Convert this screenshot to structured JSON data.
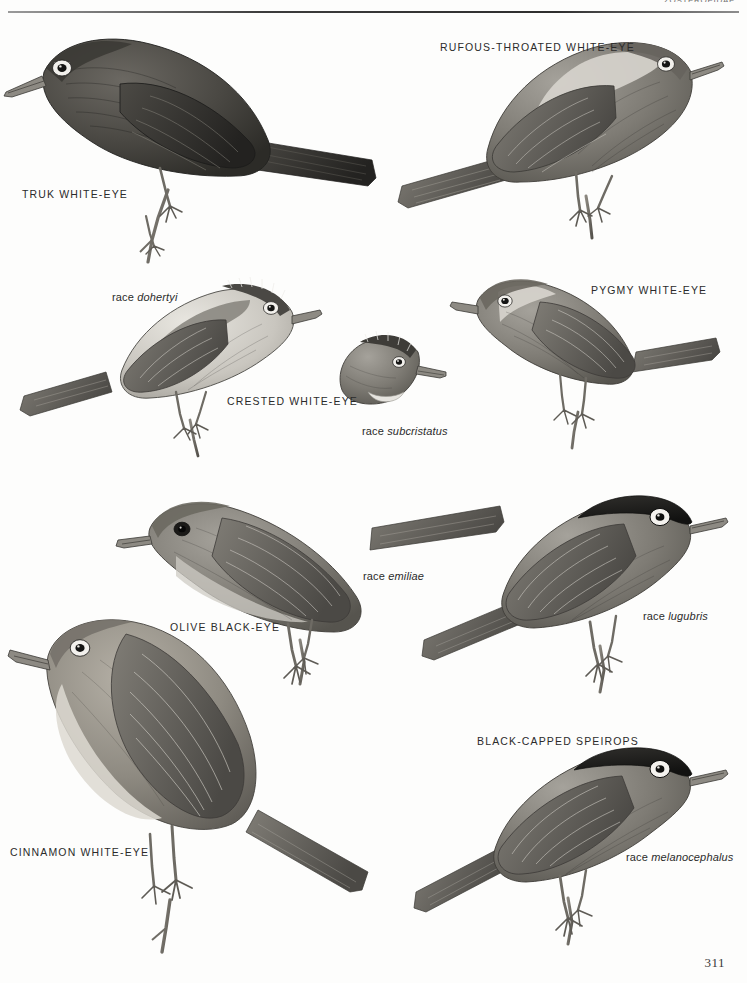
{
  "page": {
    "running_head": "ZOSTEROPIDAE",
    "page_number": "311",
    "background_color": "#fdfdfc",
    "ink_color": "#2b2b2b"
  },
  "labels": {
    "truk_white_eye": "TRUK WHITE-EYE",
    "rufous_throated_white_eye": "RUFOUS-THROATED WHITE-EYE",
    "race_dohertyi_prefix": "race ",
    "race_dohertyi_name": "dohertyi",
    "crested_white_eye": "CRESTED WHITE-EYE",
    "race_subcristatus_prefix": "race ",
    "race_subcristatus_name": "subcristatus",
    "pygmy_white_eye": "PYGMY WHITE-EYE",
    "olive_black_eye": "OLIVE BLACK-EYE",
    "race_emiliae_prefix": "race ",
    "race_emiliae_name": "emiliae",
    "race_lugubris_prefix": "race ",
    "race_lugubris_name": "lugubris",
    "black_capped_speirops": "BLACK-CAPPED SPEIROPS",
    "cinnamon_white_eye": "CINNAMON WHITE-EYE",
    "race_melanocephalus_prefix": "race ",
    "race_melanocephalus_name": "melanocephalus"
  },
  "figures": [
    {
      "id": "truk-white-eye",
      "name": "Truk White-eye",
      "plumage": "uniform dark sooty grey-brown",
      "eye_ring": "white",
      "perched_on": "twig",
      "facing": "left"
    },
    {
      "id": "rufous-throated-white-eye",
      "name": "Rufous-throated White-eye",
      "plumage": "grey-brown upperparts, pale throat",
      "eye_ring": "white",
      "perched_on": "twig",
      "facing": "right"
    },
    {
      "id": "crested-white-eye-dohertyi",
      "name": "Crested White-eye race dohertyi",
      "plumage": "grey upperparts, pale underparts, dark streaked crest",
      "eye_ring": "white",
      "perched_on": "twig",
      "facing": "right"
    },
    {
      "id": "crested-white-eye-subcristatus",
      "name": "Crested White-eye race subcristatus head",
      "plumage": "head only, streaked crown",
      "eye_ring": "white",
      "facing": "right"
    },
    {
      "id": "pygmy-white-eye",
      "name": "Pygmy White-eye",
      "plumage": "grey-brown upperparts, pale face",
      "eye_ring": "white",
      "perched_on": "twig",
      "facing": "left"
    },
    {
      "id": "olive-black-eye-emiliae",
      "name": "Olive Black-eye race emiliae",
      "plumage": "olive-grey, dark eye",
      "eye_ring": "none",
      "perched_on": "twig",
      "facing": "left"
    },
    {
      "id": "black-capped-speirops-lugubris",
      "name": "Black-capped Speirops race lugubris",
      "plumage": "black cap, grey body",
      "eye_ring": "white",
      "perched_on": "twig",
      "facing": "right"
    },
    {
      "id": "cinnamon-white-eye",
      "name": "Cinnamon White-eye",
      "plumage": "warm grey-brown, pale breast",
      "eye_ring": "white",
      "perched_on": "twig",
      "facing": "left"
    },
    {
      "id": "black-capped-speirops-melanocephalus",
      "name": "Black-capped Speirops race melanocephalus",
      "plumage": "black cap, grey body",
      "eye_ring": "white",
      "perched_on": "twig",
      "facing": "right"
    }
  ]
}
